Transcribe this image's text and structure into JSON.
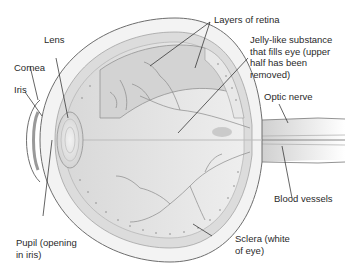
{
  "diagram": {
    "style": "grayscale medical illustration",
    "labels": {
      "layers_of_retina": "Layers of retina",
      "lens": "Lens",
      "jelly_line1": "Jelly-like substance",
      "jelly_line2": "that fills eye (upper",
      "jelly_line3": "half has been",
      "jelly_line4": "removed)",
      "cornea": "Cornea",
      "iris": "Iris",
      "optic_nerve": "Optic nerve",
      "blood_vessels": "Blood vessels",
      "pupil_line1": "Pupil (opening",
      "pupil_line2": "in iris)",
      "sclera_line1": "Sclera (white",
      "sclera_line2": "of eye)"
    },
    "colors": {
      "background": "#ffffff",
      "outline": "#6e6e6e",
      "fill_light": "#e6e6e6",
      "fill_mid": "#cfcfcf",
      "fill_dark": "#9a9a9a",
      "leader_line": "#222222",
      "text": "#2a2a2a"
    }
  }
}
